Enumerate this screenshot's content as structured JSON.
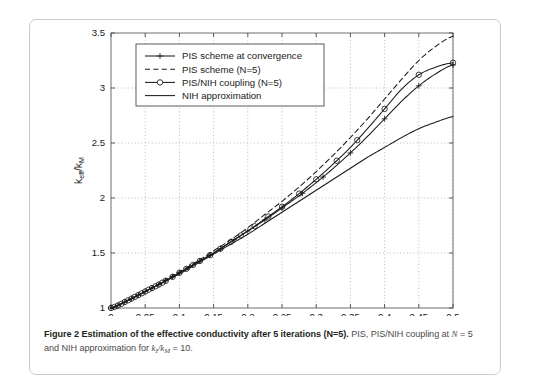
{
  "figure": {
    "caption_bold": "Figure 2 Estimation of the effective conductivity after 5 iterations (N=5).",
    "caption_rest_a": " PIS, PIS/NIH coupling at ",
    "caption_var_N": "N",
    "caption_rest_b": " = 5 and NIH approximation for ",
    "caption_var_ki": "k",
    "caption_sub_i": "I",
    "caption_slash": "/",
    "caption_var_kM": "k",
    "caption_sub_M": "M",
    "caption_rest_c": " = 10."
  },
  "chart_data": {
    "type": "line",
    "title": "",
    "xlabel": "Volume fraction f",
    "ylabel": "k_eff/k_M",
    "ylabel_parts": {
      "k": "k",
      "eff": "eff",
      "slash": "/",
      "k2": "k",
      "M": "M"
    },
    "xlim": [
      0,
      0.5
    ],
    "ylim": [
      1,
      3.5
    ],
    "xticks": [
      0,
      0.05,
      0.1,
      0.15,
      0.2,
      0.25,
      0.3,
      0.35,
      0.4,
      0.45,
      0.5
    ],
    "xticklabels": [
      "0",
      "0.05",
      "0.1",
      "0.15",
      "0.2",
      "0.25",
      "0.3",
      "0.35",
      "0.4",
      "0.45",
      "0.5"
    ],
    "yticks": [
      1,
      1.5,
      2,
      2.5,
      3,
      3.5
    ],
    "yticklabels": [
      "1",
      "1.5",
      "2",
      "2.5",
      "3",
      "3.5"
    ],
    "grid": "dotted",
    "legend_position": "top-left-inside",
    "x": [
      0,
      0.025,
      0.05,
      0.075,
      0.1,
      0.125,
      0.15,
      0.175,
      0.2,
      0.225,
      0.25,
      0.275,
      0.3,
      0.325,
      0.35,
      0.375,
      0.4,
      0.425,
      0.45,
      0.475,
      0.5
    ],
    "series": [
      {
        "name": "PIS scheme at convergence",
        "marker": "plus",
        "dash": "solid",
        "color": "#1a1a1a",
        "values": [
          1.0,
          1.07,
          1.15,
          1.23,
          1.32,
          1.41,
          1.5,
          1.6,
          1.7,
          1.8,
          1.91,
          2.02,
          2.14,
          2.27,
          2.41,
          2.56,
          2.72,
          2.88,
          3.02,
          3.13,
          3.21
        ]
      },
      {
        "name": "PIS scheme (N=5)",
        "marker": "none",
        "dash": "dashed",
        "color": "#1a1a1a",
        "values": [
          1.0,
          1.07,
          1.15,
          1.24,
          1.33,
          1.42,
          1.52,
          1.62,
          1.73,
          1.85,
          1.97,
          2.1,
          2.24,
          2.39,
          2.55,
          2.72,
          2.9,
          3.08,
          3.25,
          3.38,
          3.47
        ]
      },
      {
        "name": "PIS/NIH coupling (N=5)",
        "marker": "circle",
        "dash": "solid",
        "color": "#1a1a1a",
        "values": [
          1.0,
          1.07,
          1.15,
          1.23,
          1.32,
          1.41,
          1.5,
          1.6,
          1.7,
          1.81,
          1.92,
          2.04,
          2.17,
          2.31,
          2.46,
          2.63,
          2.81,
          2.99,
          3.12,
          3.19,
          3.23
        ]
      },
      {
        "name": "NIH approximation",
        "marker": "none",
        "dash": "solid",
        "color": "#1a1a1a",
        "values": [
          1.0,
          1.07,
          1.15,
          1.23,
          1.31,
          1.4,
          1.49,
          1.58,
          1.67,
          1.77,
          1.87,
          1.97,
          2.07,
          2.17,
          2.27,
          2.37,
          2.46,
          2.55,
          2.63,
          2.69,
          2.74
        ]
      }
    ],
    "marker_x_circle": [
      0,
      0.005,
      0.01,
      0.015,
      0.02,
      0.025,
      0.03,
      0.035,
      0.04,
      0.045,
      0.05,
      0.055,
      0.06,
      0.065,
      0.07,
      0.075,
      0.08,
      0.09,
      0.1,
      0.11,
      0.12,
      0.13,
      0.145,
      0.16,
      0.175,
      0.19,
      0.21,
      0.23,
      0.25,
      0.275,
      0.3,
      0.33,
      0.36,
      0.4,
      0.45,
      0.5
    ],
    "marker_x_plus": [
      0,
      0.01,
      0.02,
      0.03,
      0.04,
      0.05,
      0.06,
      0.07,
      0.08,
      0.09,
      0.1,
      0.115,
      0.13,
      0.145,
      0.16,
      0.18,
      0.2,
      0.225,
      0.25,
      0.28,
      0.31,
      0.35,
      0.4,
      0.45,
      0.5
    ]
  },
  "legend": {
    "items": [
      {
        "label": "PIS scheme at convergence",
        "style": "solid-plus"
      },
      {
        "label": "PIS scheme (N=5)",
        "style": "dashed"
      },
      {
        "label": "PIS/NIH coupling (N=5)",
        "style": "solid-circle"
      },
      {
        "label": "NIH approximation",
        "style": "solid"
      }
    ]
  }
}
